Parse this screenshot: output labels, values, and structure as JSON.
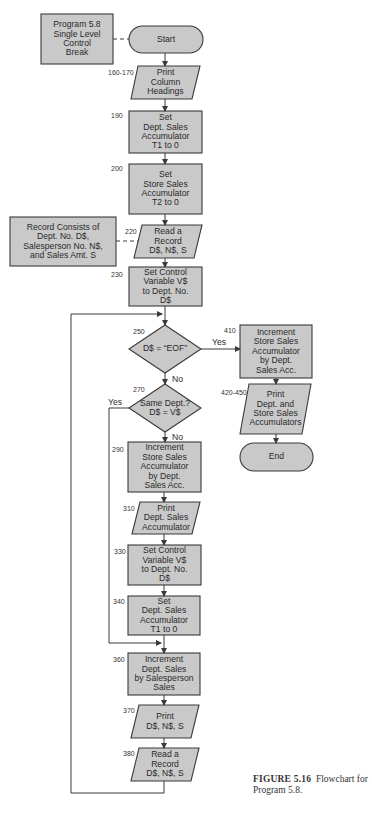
{
  "figure": {
    "caption_label": "FIGURE 5.16",
    "caption_text": "Flowchart for",
    "caption_text2": "Program 5.8."
  },
  "colors": {
    "fill": "#c9c9c9",
    "stroke": "#3a3a3a",
    "text": "#2a2a2a"
  },
  "nodes": {
    "program_note": {
      "text": "Program 5.8\nSingle Level\nControl\nBreak"
    },
    "start": {
      "text": "Start"
    },
    "print_headings": {
      "line": "160-170",
      "text": "Print\nColumn\nHeadings"
    },
    "set_t1": {
      "line": "190",
      "text": "Set\nDept. Sales\nAccumulator\nT1 to 0"
    },
    "set_t2": {
      "line": "200",
      "text": "Set\nStore Sales\nAccumulator\nT2 to 0"
    },
    "record_note": {
      "text": "Record Consists of\nDept. No. D$,\nSalesperson No. N$,\nand Sales Amt. S"
    },
    "read_record_1": {
      "line": "220",
      "text": "Read a\nRecord\nD$, N$, S"
    },
    "set_control_1": {
      "line": "230",
      "text": "Set Control\nVariable  V$\nto Dept. No.\nD$"
    },
    "eof_decision": {
      "line": "250",
      "text": "D$ = “EOF”",
      "yes": "Yes",
      "no": "No"
    },
    "same_dept_decision": {
      "line": "270",
      "text": "Same Dept.?\nD$ = V$",
      "yes": "Yes",
      "no": "No"
    },
    "inc_store_right": {
      "line": "410",
      "text": "Increment\nStore Sales\nAccumulator\nby Dept.\nSales Acc."
    },
    "print_accumulators": {
      "line": "420-450",
      "text": "Print\nDept. and\nStore Sales\nAccumulators"
    },
    "end": {
      "text": "End"
    },
    "inc_store_left": {
      "line": "290",
      "text": "Increment\nStore Sales\nAccumulator\nby Dept.\nSales Acc."
    },
    "print_dept": {
      "line": "310",
      "text": "Print\nDept. Sales\nAccumulator"
    },
    "set_control_2": {
      "line": "330",
      "text": "Set Control\nVariable V$\nto Dept. No.\nD$"
    },
    "set_t1_again": {
      "line": "340",
      "text": "Set\nDept. Sales\nAccumulator\nT1 to 0"
    },
    "inc_dept": {
      "line": "360",
      "text": "Increment\nDept. Sales\nby Salesperson\nSales"
    },
    "print_record": {
      "line": "370",
      "text": "Print\nD$, N$, S"
    },
    "read_record_2": {
      "line": "380",
      "text": "Read a\nRecord\nD$, N$, S"
    }
  }
}
